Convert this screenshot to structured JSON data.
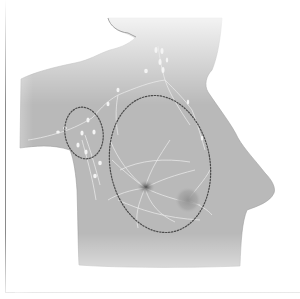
{
  "figure": {
    "type": "anatomical-illustration",
    "regions": [
      {
        "name": "axillary-lymph-node-region",
        "outline": "dotted-ellipse"
      },
      {
        "name": "breast-tissue-region",
        "outline": "dotted-ellipse"
      }
    ],
    "features": [
      "nipple-areola",
      "tumor-mass",
      "lymph-nodes",
      "lymphatic-vessels"
    ],
    "caption": ""
  },
  "colors": {
    "background": "#ffffff",
    "body_fill": "#b9b9b9",
    "body_shadow": "#a6a6a6",
    "lymph": "#f2f2f2",
    "dotted_outline": "#4a4a4a",
    "nipple": "#5e5e5e",
    "tumor": "#9a9a9a",
    "frame": "#8a8a8a"
  }
}
